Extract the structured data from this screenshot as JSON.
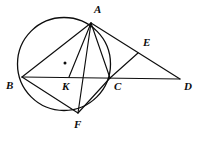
{
  "figure": {
    "type": "geometry-diagram",
    "canvas": {
      "width": 202,
      "height": 142,
      "background": "#ffffff"
    },
    "ink_color": "#0d0d0d"
  },
  "circle": {
    "label": "circumcircle",
    "cx": 64,
    "cy": 64,
    "r": 46.5
  },
  "center_marker": {
    "label": "circle-center-dot",
    "cx": 65,
    "cy": 63,
    "r": 1.5
  },
  "points": [
    {
      "id": "A",
      "label": "A",
      "x": 91,
      "y": 23,
      "label_x": 94,
      "label_y": 4
    },
    {
      "id": "B",
      "label": "B",
      "x": 22,
      "y": 77,
      "label_x": 6,
      "label_y": 80
    },
    {
      "id": "C",
      "label": "C",
      "x": 110,
      "y": 78,
      "label_x": 114,
      "label_y": 81
    },
    {
      "id": "D",
      "label": "D",
      "x": 180,
      "y": 79,
      "label_x": 184,
      "label_y": 81
    },
    {
      "id": "E",
      "label": "E",
      "x": 138,
      "y": 53,
      "label_x": 143,
      "label_y": 37
    },
    {
      "id": "F",
      "label": "F",
      "x": 78,
      "y": 113,
      "label_x": 74,
      "label_y": 119
    },
    {
      "id": "K",
      "label": "K",
      "x": 69,
      "y": 77,
      "label_x": 62,
      "label_y": 81
    }
  ],
  "segments": [
    {
      "name": "segment-B-D",
      "from": "B",
      "to": "D"
    },
    {
      "name": "segment-A-B",
      "from": "A",
      "to": "B"
    },
    {
      "name": "segment-A-F",
      "from": "A",
      "to": "F"
    },
    {
      "name": "segment-A-C",
      "from": "A",
      "to": "C"
    },
    {
      "name": "segment-A-D",
      "from": "A",
      "to": "D"
    },
    {
      "name": "segment-B-F",
      "from": "B",
      "to": "F"
    },
    {
      "name": "segment-F-C",
      "from": "F",
      "to": "C"
    },
    {
      "name": "segment-C-E",
      "from": "C",
      "to": "E"
    },
    {
      "name": "segment-A-K",
      "from": "A",
      "to": "K"
    }
  ]
}
